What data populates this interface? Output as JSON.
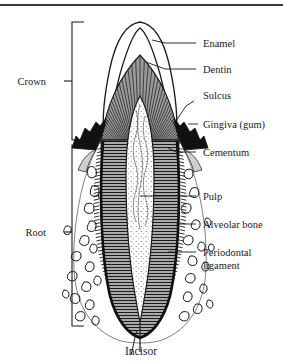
{
  "figure": {
    "caption": "Incisor",
    "colors": {
      "ink": "#1b1b1b",
      "rule": "#3a3a3a",
      "dentin_fill": "#8e8e8e",
      "enamel_fill": "#ffffff",
      "gingiva_fill": "#111111",
      "pulp_fill": "#fdfdfd",
      "bone_fill": "#ffffff",
      "background": "#ffffff"
    }
  },
  "brackets": [
    {
      "id": "crown",
      "label": "Crown",
      "label_x": 46,
      "label_y": 85,
      "top": 22,
      "bottom": 140,
      "x": 72,
      "tick_y": 81
    },
    {
      "id": "root",
      "label": "Root",
      "label_x": 52,
      "label_y": 232,
      "top": 145,
      "bottom": 326,
      "x": 72,
      "tick_y": 232
    }
  ],
  "labels": [
    {
      "id": "enamel",
      "text": "Enamel",
      "x": 203,
      "y": 43,
      "leader": [
        [
          165,
          43
        ],
        [
          196,
          43
        ]
      ],
      "target": [
        152,
        40
      ]
    },
    {
      "id": "dentin",
      "text": "Dentin",
      "x": 203,
      "y": 69,
      "leader": [
        [
          165,
          69
        ],
        [
          196,
          69
        ]
      ],
      "target": [
        143,
        60
      ]
    },
    {
      "id": "sulcus",
      "text": "Sulcus",
      "x": 203,
      "y": 95,
      "leader": [
        [
          180,
          102
        ],
        [
          190,
          98
        ]
      ],
      "target": [
        172,
        122
      ]
    },
    {
      "id": "gingiva",
      "text": "Gingiva (gum)",
      "x": 203,
      "y": 124,
      "leader": [
        [
          190,
          124
        ],
        [
          198,
          124
        ]
      ],
      "target": [
        186,
        125
      ]
    },
    {
      "id": "cementum",
      "text": "Cementum",
      "x": 203,
      "y": 152,
      "leader": [
        [
          178,
          152
        ],
        [
          196,
          152
        ]
      ],
      "target": [
        172,
        150
      ]
    },
    {
      "id": "pulp",
      "text": "Pulp",
      "x": 203,
      "y": 196,
      "leader": [
        [
          138,
          196
        ],
        [
          196,
          196
        ]
      ],
      "target": [
        138,
        196
      ]
    },
    {
      "id": "alveolar",
      "text": "Alveolar bone",
      "x": 203,
      "y": 224,
      "leader": [
        [
          180,
          224
        ],
        [
          196,
          224
        ]
      ],
      "target": [
        176,
        224
      ]
    },
    {
      "id": "periodontal",
      "text": "Periodontal",
      "x": 203,
      "y": 252,
      "leader": [
        [
          172,
          252
        ],
        [
          196,
          252
        ]
      ],
      "target": [
        168,
        252
      ]
    },
    {
      "id": "ligament",
      "text": "ligament",
      "x": 203,
      "y": 265,
      "leader": [],
      "target": []
    }
  ],
  "structures": [
    {
      "id": "enamel-layer",
      "name": "Enamel"
    },
    {
      "id": "dentin-layer",
      "name": "Dentin"
    },
    {
      "id": "pulp-chamber",
      "name": "Pulp"
    },
    {
      "id": "gingiva-left",
      "name": "Gingiva (gum)"
    },
    {
      "id": "gingiva-right",
      "name": "Gingiva (gum)"
    },
    {
      "id": "cementum-layer",
      "name": "Cementum"
    },
    {
      "id": "periodontal-ligament",
      "name": "Periodontal ligament"
    },
    {
      "id": "alveolar-bone",
      "name": "Alveolar bone"
    },
    {
      "id": "sulcus-groove",
      "name": "Sulcus"
    }
  ]
}
